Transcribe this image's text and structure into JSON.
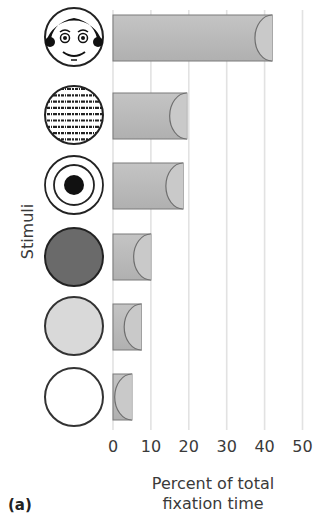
{
  "chart_data": {
    "type": "bar",
    "orientation": "horizontal",
    "title": "",
    "panel_label": "(a)",
    "xlabel_line1": "Percent of total",
    "xlabel_line2": "fixation time",
    "ylabel": "Stimuli",
    "categories": [
      "Face",
      "Newsprint",
      "Bullseye",
      "Dark solid circle",
      "Light solid circle",
      "White circle"
    ],
    "values": [
      42,
      19.5,
      18.5,
      10,
      7.5,
      5
    ],
    "xlim": [
      0,
      50
    ],
    "xticks": [
      "0",
      "10",
      "20",
      "30",
      "40",
      "50"
    ],
    "grid": "vertical",
    "legend": null
  },
  "colors": {
    "bar_fill": "#bdbdbd",
    "bar_stroke": "#7a7a7a",
    "grid": "#e2e2e2",
    "dark_circle": "#6a6a6a",
    "light_circle": "#d9d9d9"
  }
}
